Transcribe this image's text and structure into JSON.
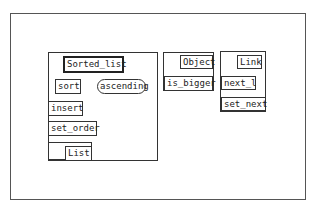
{
  "diagram": {
    "classes": [
      {
        "name": "Sorted_list",
        "features": [
          "sort",
          "insert",
          "set_order"
        ],
        "attributes_rounded": [
          "ascending"
        ],
        "parent": "List"
      },
      {
        "name": "Object",
        "features": [
          "is_bigger"
        ]
      },
      {
        "name": "Link",
        "features": [
          "next_l",
          "set_next"
        ]
      }
    ]
  },
  "labels": {
    "sorted_list": "Sorted_list",
    "sort": "sort",
    "ascending": "ascending",
    "insert": "insert",
    "set_order": "set_order",
    "list": "List",
    "object": "Object",
    "is_bigger": "is_bigger",
    "link": "Link",
    "next_l": "next_l",
    "set_next": "set_next"
  },
  "colors": {
    "background": "#ffffff",
    "stroke": "#333333"
  }
}
